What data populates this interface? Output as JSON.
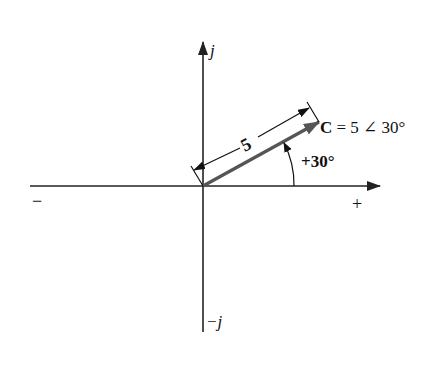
{
  "diagram": {
    "type": "phasor",
    "axes": {
      "positive_imaginary_label": "j",
      "negative_imaginary_label": "−j",
      "positive_real_label": "+",
      "negative_real_label": "−"
    },
    "vector": {
      "name": "C",
      "magnitude": 5,
      "angle_deg": 30,
      "label_prefix": "C",
      "label_rest": " = 5 ∠ 30°",
      "magnitude_label": "5",
      "angle_label": "+30°"
    },
    "colors": {
      "axis": "#222222",
      "vector": "#555555",
      "text": "#111111"
    }
  }
}
